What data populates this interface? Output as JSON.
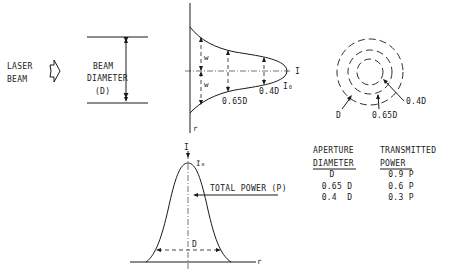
{
  "left": {
    "laser_label_1": "LASER",
    "laser_label_2": "BEAM",
    "beam_label_1": "BEAM",
    "beam_label_2": "DIAMETER",
    "beam_label_3": "(D)"
  },
  "profile_top": {
    "axis_label_r": "r",
    "intensity_label": "I",
    "peak_label": "I₀",
    "marker_w": "w",
    "label_065": "0.65D",
    "label_04": "0.4D"
  },
  "circles": {
    "label_outer": "D",
    "label_middle": "0.65D",
    "label_inner": "0.4D"
  },
  "table": {
    "col1_header_1": "APERTURE",
    "col1_header_2": "DIAMETER",
    "col2_header_1": "TRANSMITTED",
    "col2_header_2": "POWER",
    "rows": [
      {
        "aperture": "D",
        "power": "0.9 P"
      },
      {
        "aperture": "0.65 D",
        "power": "0.6 P"
      },
      {
        "aperture": "0.4  D",
        "power": "0.3 P"
      }
    ]
  },
  "gaussian": {
    "axis_y": "I",
    "peak": "I₀",
    "axis_x": "r",
    "total_power": "TOTAL POWER (P)",
    "width_label": "D"
  }
}
